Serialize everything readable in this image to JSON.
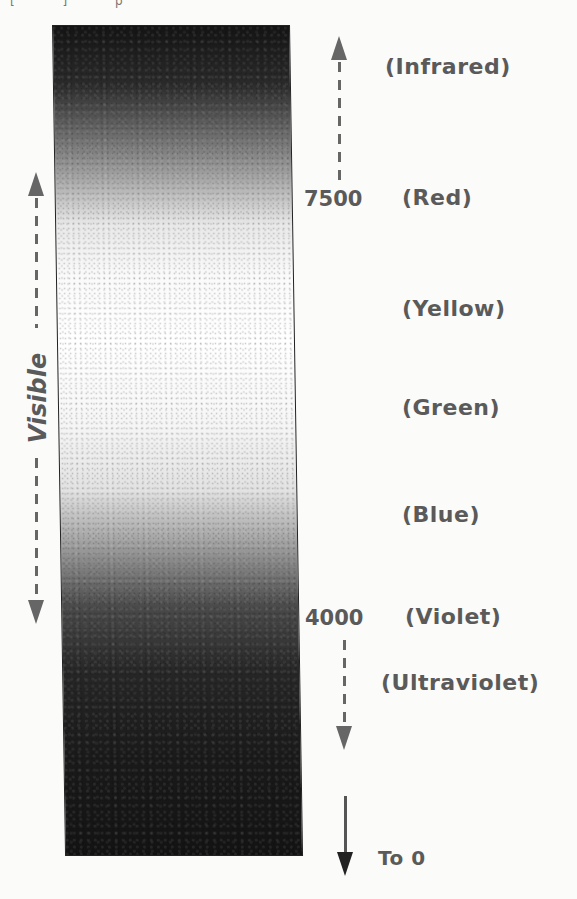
{
  "figure": {
    "type": "electromagnetic-spectrum-visible-range",
    "top_fragment": "[ ] p",
    "side_label": "Visible",
    "bands": [
      {
        "id": "infrared",
        "label": "(Infrared)",
        "wavelength": ""
      },
      {
        "id": "red",
        "label": "(Red)",
        "wavelength": "7500"
      },
      {
        "id": "yellow",
        "label": "(Yellow)",
        "wavelength": ""
      },
      {
        "id": "green",
        "label": "(Green)",
        "wavelength": ""
      },
      {
        "id": "blue",
        "label": "(Blue)",
        "wavelength": ""
      },
      {
        "id": "violet",
        "label": "(Violet)",
        "wavelength": "4000"
      },
      {
        "id": "ultraviolet",
        "label": "(Ultraviolet)",
        "wavelength": ""
      }
    ],
    "bottom_label": "To 0",
    "colors": {
      "ink": "#5a5a5a",
      "bar_dark": "#141414",
      "bar_light": "#ffffff",
      "background": "#fbfbfa"
    }
  }
}
